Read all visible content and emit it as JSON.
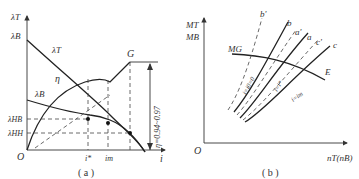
{
  "figure_a": {
    "caption": "( a )",
    "y_axis_label": "λT",
    "y_labels": {
      "lambda_B": "λB",
      "lambda_HB": "λHB",
      "lambda_HH": "λHH"
    },
    "origin": "O",
    "x_axis_label": "i",
    "x_ticks": {
      "i_star": "i*",
      "i_m": "im"
    },
    "curve_labels": {
      "lambda_T": "λT",
      "eta": "η",
      "lambda_B": "λB",
      "G": "G"
    },
    "annotation": "η=0.94~0.97"
  },
  "figure_b": {
    "caption": "( b )",
    "y_axis_label_1": "MT",
    "y_axis_label_2": "MB",
    "origin": "O",
    "x_axis_label": "nT(nB)",
    "curve_label_mg": "MG",
    "point_E": "E",
    "curve_labels": [
      "b'",
      "b",
      "a'",
      "a",
      "c'",
      "c"
    ],
    "inline_labels": {
      "i_zero": "i=i0=0",
      "i_star": "i=i*",
      "i_m": "i=im"
    }
  }
}
